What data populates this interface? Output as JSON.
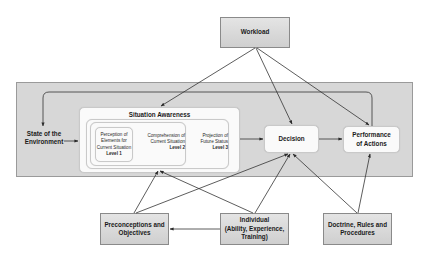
{
  "diagram": {
    "workload": {
      "label": "Workload"
    },
    "state_of_environment": {
      "label": "State of the Environment",
      "line1": "State of the",
      "line2": "Environment"
    },
    "situation_awareness": {
      "title": "Situation Awareness",
      "level1": {
        "line1": "Perception of",
        "line2": "Elements for",
        "line3": "Current Situation",
        "level": "Level 1"
      },
      "level2": {
        "line1": "Comprehension of",
        "line2": "Current Situation",
        "level": "Level 2"
      },
      "level3": {
        "line1": "Projection of",
        "line2": "Future Status",
        "level": "Level 3"
      }
    },
    "decision": {
      "label": "Decision"
    },
    "performance": {
      "line1": "Performance",
      "line2": "of Actions"
    },
    "preconceptions": {
      "line1": "Preconceptions and",
      "line2": "Objectives"
    },
    "individual": {
      "line1": "Individual",
      "line2": "(Ability, Experience,",
      "line3": "Training)"
    },
    "doctrine": {
      "line1": "Doctrine, Rules and",
      "line2": "Procedures"
    },
    "colors": {
      "panel": "#d7d7d7",
      "gray_box": "#d9d9d9",
      "white_box": "#fafafa",
      "line": "#333333"
    },
    "connections": [
      {
        "from": "Workload",
        "to": "Situation Awareness"
      },
      {
        "from": "Workload",
        "to": "Decision"
      },
      {
        "from": "Workload",
        "to": "Performance of Actions"
      },
      {
        "from": "State of the Environment",
        "to": "Situation Awareness"
      },
      {
        "from": "Situation Awareness",
        "to": "Decision"
      },
      {
        "from": "Decision",
        "to": "Performance of Actions"
      },
      {
        "from": "Performance of Actions",
        "to": "State of the Environment",
        "type": "feedback"
      },
      {
        "from": "Preconceptions and Objectives",
        "to": "Situation Awareness"
      },
      {
        "from": "Preconceptions and Objectives",
        "to": "Decision"
      },
      {
        "from": "Individual",
        "to": "Situation Awareness"
      },
      {
        "from": "Individual",
        "to": "Decision"
      },
      {
        "from": "Individual",
        "to": "Preconceptions and Objectives"
      },
      {
        "from": "Doctrine, Rules and Procedures",
        "to": "Decision"
      },
      {
        "from": "Doctrine, Rules and Procedures",
        "to": "Performance of Actions"
      }
    ]
  }
}
